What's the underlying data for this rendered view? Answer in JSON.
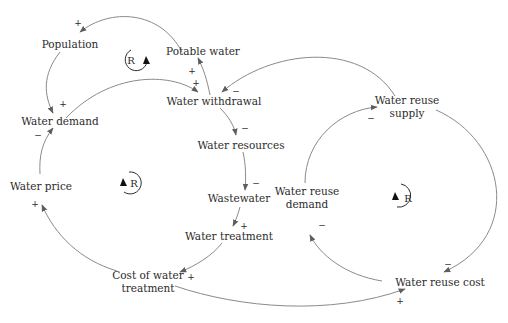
{
  "diagram": {
    "type": "causal-loop-diagram",
    "colors": {
      "link": "#8a8a8a",
      "arrowhead": "#5e5e5e",
      "text": "#2b2b2b",
      "loop_arrow": "#111111"
    },
    "nodes": {
      "population": "Population",
      "potable_water": "Potable water",
      "water_withdrawal": "Water withdrawal",
      "water_demand": "Water demand",
      "water_resources": "Water resources",
      "water_price": "Water price",
      "wastewater": "Wastewater",
      "water_treatment": "Water treatment",
      "cost_of_water_treatment_line1": "Cost of water",
      "cost_of_water_treatment_line2": "treatment",
      "water_reuse_supply_line1": "Water reuse",
      "water_reuse_supply_line2": "supply",
      "water_reuse_demand_line1": "Water reuse",
      "water_reuse_demand_line2": "demand",
      "water_reuse_cost": "Water reuse cost"
    },
    "loops": [
      {
        "id": "loop1",
        "label": "R",
        "polarity": "reinforcing"
      },
      {
        "id": "loop2",
        "label": "R",
        "polarity": "reinforcing"
      },
      {
        "id": "loop3",
        "label": "R",
        "polarity": "reinforcing"
      }
    ],
    "links": [
      {
        "from": "Potable water",
        "to": "Population",
        "sign": "+"
      },
      {
        "from": "Population",
        "to": "Water demand",
        "sign": "+"
      },
      {
        "from": "Water demand",
        "to": "Water withdrawal",
        "sign": "+"
      },
      {
        "from": "Water withdrawal",
        "to": "Potable water",
        "sign": "+"
      },
      {
        "from": "Water reuse supply",
        "to": "Water withdrawal",
        "sign": "−"
      },
      {
        "from": "Water withdrawal",
        "to": "Water resources",
        "sign": "−"
      },
      {
        "from": "Water resources",
        "to": "Wastewater",
        "sign": "−"
      },
      {
        "from": "Wastewater",
        "to": "Water treatment",
        "sign": "+"
      },
      {
        "from": "Water treatment",
        "to": "Cost of water treatment",
        "sign": "+"
      },
      {
        "from": "Cost of water treatment",
        "to": "Water price",
        "sign": "+"
      },
      {
        "from": "Water price",
        "to": "Water demand",
        "sign": "−"
      },
      {
        "from": "Cost of water treatment",
        "to": "Water reuse cost",
        "sign": "+"
      },
      {
        "from": "Water reuse supply",
        "to": "Water reuse cost",
        "sign": "−"
      },
      {
        "from": "Water reuse cost",
        "to": "Water reuse demand",
        "sign": "−"
      },
      {
        "from": "Water reuse demand",
        "to": "Water reuse supply",
        "sign": "−"
      }
    ],
    "signs": {
      "s_pot_pop": "+",
      "s_pop_dem": "+",
      "s_dem_wd": "+",
      "s_wd_pot": "+",
      "s_sup_wd": "−",
      "s_wd_res": "−",
      "s_res_ww": "−",
      "s_ww_wt": "+",
      "s_wt_cost": "+",
      "s_cost_price": "+",
      "s_price_dem": "−",
      "s_cost_rcost": "+",
      "s_sup_rcost": "−",
      "s_rcost_rdem": "−",
      "s_rdem_sup": "−"
    },
    "loop_labels": {
      "loop1": "R",
      "loop2": "R",
      "loop3": "R"
    }
  }
}
